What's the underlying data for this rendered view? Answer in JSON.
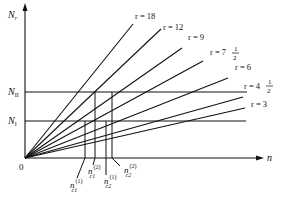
{
  "diagram": {
    "axes": {
      "y_label": "N",
      "y_label_sub": "r",
      "x_label": "n",
      "origin_label": "0"
    },
    "levels": [
      {
        "id": "N_II",
        "label": "N",
        "sub": "II"
      },
      {
        "id": "N_I",
        "label": "N",
        "sub": "I"
      }
    ],
    "rays": [
      {
        "r": "18",
        "label": "r = 18"
      },
      {
        "r": "12",
        "label": "r = 12"
      },
      {
        "r": "9",
        "label": "r = 9"
      },
      {
        "r": "7 1/2",
        "label": "r = 7",
        "frac_num": "1",
        "frac_den": "2"
      },
      {
        "r": "6",
        "label": "r = 6"
      },
      {
        "r": "4 1/2",
        "label": "r = 4",
        "frac_num": "1",
        "frac_den": "2"
      },
      {
        "r": "3",
        "label": "r = 3"
      }
    ],
    "critical_points": [
      {
        "base": "n",
        "sub": "c1",
        "sup": "(1)"
      },
      {
        "base": "n",
        "sub": "c1",
        "sup": "(2)"
      },
      {
        "base": "n",
        "sub": "c2",
        "sup": "(1)"
      },
      {
        "base": "n",
        "sub": "c2",
        "sup": "(2)"
      }
    ]
  }
}
